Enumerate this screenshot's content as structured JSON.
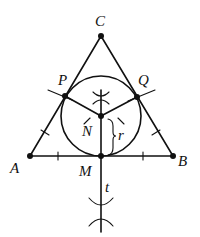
{
  "diagram": {
    "labels": {
      "A": "A",
      "B": "B",
      "C": "C",
      "P": "P",
      "Q": "Q",
      "N": "N",
      "M": "M",
      "r": "r",
      "t": "t"
    },
    "points": {
      "A": [
        30,
        156
      ],
      "B": [
        173,
        156
      ],
      "C": [
        101,
        36
      ],
      "P": [
        65,
        96
      ],
      "Q": [
        137,
        97
      ],
      "N": [
        101,
        116
      ],
      "M": [
        101,
        156
      ]
    },
    "circle": {
      "center": "N",
      "radius": 40
    },
    "line_t": "perpendicular bisector through M",
    "colors": {
      "stroke": "#111111",
      "background": "#ffffff"
    }
  }
}
